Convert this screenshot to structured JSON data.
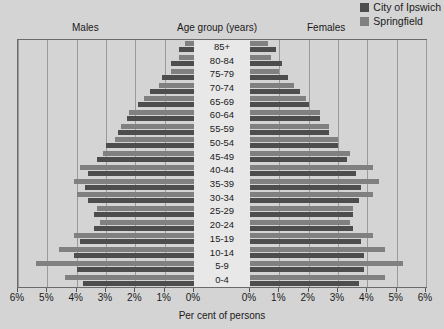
{
  "legend": {
    "items": [
      {
        "label": "City of Ipswich",
        "color": "#4d4d4d"
      },
      {
        "label": "Springfield",
        "color": "#808080"
      }
    ]
  },
  "headers": {
    "males": "Males",
    "age_group": "Age group  (years)",
    "females": "Females"
  },
  "axis": {
    "xlabel": "Per cent of persons",
    "tick_labels": [
      "6%",
      "5%",
      "4%",
      "3%",
      "2%",
      "1%",
      "0%",
      "0%",
      "1%",
      "2%",
      "3%",
      "4%",
      "5%",
      "6%"
    ]
  },
  "chart_data": {
    "type": "bar",
    "title": "",
    "subtitle": "",
    "xlabel": "Per cent of persons",
    "ylabel": "Age group  (years)",
    "xlim": [
      0,
      6
    ],
    "grid": true,
    "legend_position": "top-right",
    "orientation": "population-pyramid",
    "side_labels": {
      "left": "Males",
      "right": "Females"
    },
    "categories": [
      "85+",
      "80-84",
      "75-79",
      "70-74",
      "65-69",
      "60-64",
      "55-59",
      "50-54",
      "45-49",
      "40-44",
      "35-39",
      "30-34",
      "25-29",
      "20-24",
      "15-19",
      "10-14",
      "5-9",
      "0-4"
    ],
    "series": [
      {
        "name": "City of Ipswich",
        "color": "#4d4d4d",
        "males": [
          0.5,
          0.8,
          1.1,
          1.5,
          1.9,
          2.3,
          2.6,
          3.0,
          3.3,
          3.6,
          3.7,
          3.6,
          3.4,
          3.4,
          3.9,
          4.1,
          4.0,
          3.8
        ],
        "females": [
          0.9,
          1.1,
          1.3,
          1.7,
          2.0,
          2.4,
          2.7,
          3.0,
          3.3,
          3.6,
          3.8,
          3.7,
          3.5,
          3.5,
          3.8,
          3.9,
          3.9,
          3.7
        ]
      },
      {
        "name": "Springfield",
        "color": "#808080",
        "males": [
          0.3,
          0.5,
          0.8,
          1.2,
          1.7,
          2.2,
          2.5,
          2.7,
          3.1,
          3.9,
          4.1,
          4.0,
          3.3,
          3.2,
          4.1,
          4.6,
          5.4,
          4.4
        ],
        "females": [
          0.6,
          0.7,
          1.0,
          1.5,
          1.9,
          2.4,
          2.7,
          3.0,
          3.4,
          4.2,
          4.4,
          4.2,
          3.5,
          3.4,
          4.2,
          4.6,
          5.2,
          4.6
        ]
      }
    ]
  }
}
